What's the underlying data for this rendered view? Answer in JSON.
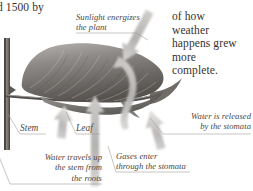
{
  "page": {
    "background_color": "#ffffff",
    "ink_color": "#36322f",
    "label_color": "#4b4845",
    "illustration_gray": "#8e8b88"
  },
  "body_text": {
    "left_fragment": "d 1500 by",
    "right_column": "of how\nweather\nhappens grew\nmore\ncomplete."
  },
  "diagram": {
    "title_semantic": "leaf-photosynthesis-diagram",
    "labels": [
      {
        "id": "sunlight",
        "text": "Sunlight energizes\nthe plant",
        "align": "left"
      },
      {
        "id": "stem",
        "text": "Stem",
        "align": "left"
      },
      {
        "id": "leaf",
        "text": "Leaf",
        "align": "left"
      },
      {
        "id": "water-up",
        "text": "Water travels up\nthe stem from\nthe roots",
        "align": "right"
      },
      {
        "id": "gases",
        "text": "Gases enter\nthrough the stomata",
        "align": "left"
      },
      {
        "id": "released",
        "text": "Water is released\nby the stomata",
        "align": "right"
      }
    ],
    "arrows": [
      {
        "id": "sunlight-arrow",
        "direction": "down-left",
        "meaning": "sunlight striking leaf"
      },
      {
        "id": "water-up-arrow",
        "direction": "up",
        "meaning": "water travelling up the stem"
      },
      {
        "id": "gases-in-arrow",
        "direction": "up",
        "meaning": "gases entering stomata"
      },
      {
        "id": "water-out-arrow",
        "direction": "up-right",
        "meaning": "water released by stomata"
      },
      {
        "id": "vapor-curl-arrow",
        "direction": "curl-up",
        "meaning": "water vapour leaving leaf"
      }
    ]
  }
}
